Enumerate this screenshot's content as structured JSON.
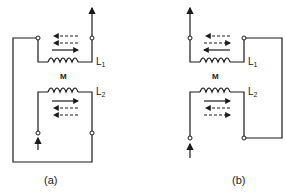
{
  "diagram": {
    "type": "mutually-coupled-coils",
    "stroke_color": "#1a1a1a",
    "background": "#ffffff",
    "panels": [
      {
        "id": "a",
        "caption": "(a)",
        "mutual_label": "M",
        "coil_top": {
          "label": "L",
          "subscript": "1"
        },
        "coil_bottom": {
          "label": "L",
          "subscript": "2"
        },
        "return_loop_side": "left",
        "top_arrows": [
          {
            "style": "dashed-double",
            "direction": "left"
          },
          {
            "style": "dashed",
            "direction": "left"
          },
          {
            "style": "solid",
            "direction": "right"
          }
        ],
        "bottom_arrows": [
          {
            "style": "solid",
            "direction": "right"
          },
          {
            "style": "dashed",
            "direction": "left"
          },
          {
            "style": "dashed-double",
            "direction": "left"
          }
        ],
        "current_in": "bottom-left terminal, upward",
        "current_out": "top-right terminal, upward"
      },
      {
        "id": "b",
        "caption": "(b)",
        "mutual_label": "M",
        "coil_top": {
          "label": "L",
          "subscript": "1"
        },
        "coil_bottom": {
          "label": "L",
          "subscript": "2"
        },
        "return_loop_side": "right",
        "top_arrows": [
          {
            "style": "dashed-double",
            "direction": "left"
          },
          {
            "style": "dashed",
            "direction": "right"
          },
          {
            "style": "solid",
            "direction": "left"
          }
        ],
        "bottom_arrows": [
          {
            "style": "solid",
            "direction": "right"
          },
          {
            "style": "dashed",
            "direction": "left"
          },
          {
            "style": "dashed-double",
            "direction": "right"
          }
        ],
        "current_in": "bottom-left terminal, upward",
        "current_out": "top-left terminal, upward"
      }
    ]
  }
}
